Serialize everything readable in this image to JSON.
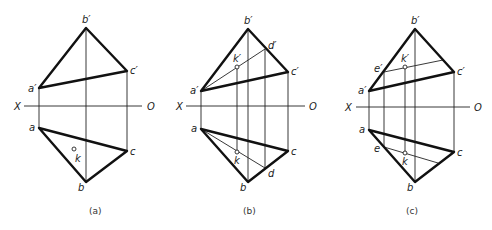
{
  "figure": {
    "axis": {
      "x_label": "X",
      "o_label": "O"
    },
    "panels": [
      {
        "caption": "(a)",
        "labels": {
          "b_prime": "b′",
          "c_prime": "c′",
          "a_prime": "a′",
          "a": "a",
          "b": "b",
          "c": "c",
          "k": "k"
        }
      },
      {
        "caption": "(b)",
        "labels": {
          "b_prime": "b′",
          "c_prime": "c′",
          "a_prime": "a′",
          "d_prime": "d′",
          "k_prime": "k′",
          "a": "a",
          "b": "b",
          "c": "c",
          "d": "d",
          "k": "k"
        }
      },
      {
        "caption": "(c)",
        "labels": {
          "b_prime": "b′",
          "c_prime": "c′",
          "a_prime": "a′",
          "e_prime": "e′",
          "k_prime": "k′",
          "a": "a",
          "b": "b",
          "c": "c",
          "e": "e",
          "k": "k"
        }
      }
    ]
  }
}
